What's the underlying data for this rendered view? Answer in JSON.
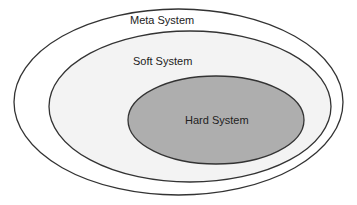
{
  "diagram": {
    "type": "nested-ellipses",
    "layers": [
      {
        "id": "meta",
        "label": "Meta System",
        "fill": "#ffffff",
        "stroke": "#333333"
      },
      {
        "id": "soft",
        "label": "Soft System",
        "fill": "#f3f3f3",
        "stroke": "#333333"
      },
      {
        "id": "hard",
        "label": "Hard System",
        "fill": "#aeaeae",
        "stroke": "#333333"
      }
    ]
  }
}
